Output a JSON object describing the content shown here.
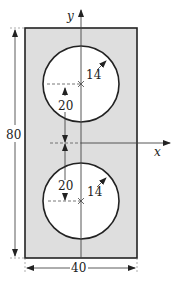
{
  "figure": {
    "type": "cross-section",
    "colors": {
      "plate_fill": "#e0e0e0",
      "outline": "#222222",
      "hole_fill": "#ffffff",
      "dimension": "#333333"
    }
  },
  "axes": {
    "x_label": "x",
    "y_label": "y"
  },
  "dimensions": {
    "height_label": "80",
    "width_label": "40",
    "upper_hole_offset_label": "20",
    "lower_hole_offset_label": "20",
    "upper_hole_radius_label": "14",
    "lower_hole_radius_label": "14"
  }
}
